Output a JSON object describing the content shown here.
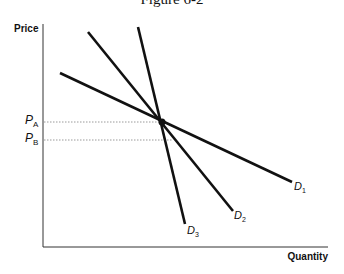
{
  "figure": {
    "title": "Figure 6-2"
  },
  "axes": {
    "y_label": "Price",
    "x_label": "Quantity"
  },
  "price_levels": [
    {
      "letter": "P",
      "sub": "A",
      "y": 122
    },
    {
      "letter": "P",
      "sub": "B",
      "y": 140
    }
  ],
  "curves": [
    {
      "letter": "D",
      "sub": "1",
      "x1": 60,
      "y1": 73,
      "x2": 292,
      "y2": 182
    },
    {
      "letter": "D",
      "sub": "2",
      "x1": 88,
      "y1": 32,
      "x2": 233,
      "y2": 211
    },
    {
      "letter": "D",
      "sub": "3",
      "x1": 138,
      "y1": 27,
      "x2": 185,
      "y2": 224
    }
  ],
  "intersection": {
    "x": 162,
    "y": 122
  },
  "colors": {
    "line": "#111111",
    "guide": "#9a9a9a"
  }
}
